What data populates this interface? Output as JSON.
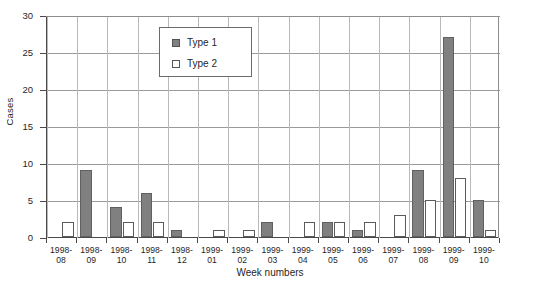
{
  "chart_data": {
    "type": "bar",
    "title": "",
    "xlabel": "Week numbers",
    "ylabel": "Cases",
    "ylim": [
      0,
      30
    ],
    "yticks": [
      0,
      5,
      10,
      15,
      20,
      25,
      30
    ],
    "grid": true,
    "legend_position": "top-center-left",
    "categories": [
      "1998-08",
      "1998-09",
      "1998-10",
      "1998-11",
      "1998-12",
      "1999-01",
      "1999-02",
      "1999-03",
      "1999-04",
      "1999-05",
      "1999-06",
      "1999-07",
      "1999-08",
      "1999-09",
      "1999-10"
    ],
    "category_lines": [
      [
        "1998-",
        "08"
      ],
      [
        "1998-",
        "09"
      ],
      [
        "1998-",
        "10"
      ],
      [
        "1998-",
        "11"
      ],
      [
        "1998-",
        "12"
      ],
      [
        "1999-",
        "01"
      ],
      [
        "1999-",
        "02"
      ],
      [
        "1999-",
        "03"
      ],
      [
        "1999-",
        "04"
      ],
      [
        "1999-",
        "05"
      ],
      [
        "1999-",
        "06"
      ],
      [
        "1999-",
        "07"
      ],
      [
        "1999-",
        "08"
      ],
      [
        "1999-",
        "09"
      ],
      [
        "1999-",
        "10"
      ]
    ],
    "series": [
      {
        "name": "Type 1",
        "color": "#808080",
        "values": [
          0,
          9,
          4,
          6,
          1,
          0,
          0,
          2,
          0,
          2,
          1,
          0,
          9,
          27,
          5
        ]
      },
      {
        "name": "Type 2",
        "color": "#ffffff",
        "values": [
          2,
          0,
          2,
          2,
          0,
          1,
          1,
          0,
          2,
          2,
          2,
          3,
          5,
          8,
          1
        ]
      }
    ]
  },
  "legend": {
    "entries": [
      {
        "label": "Type 1",
        "swatch": "filled-gray-square"
      },
      {
        "label": "Type 2",
        "swatch": "white-square"
      }
    ]
  },
  "axes": {
    "y_tick_labels": [
      "0",
      "5",
      "10",
      "15",
      "20",
      "25",
      "30"
    ],
    "y_title": "Cases",
    "x_title": "Week numbers"
  }
}
